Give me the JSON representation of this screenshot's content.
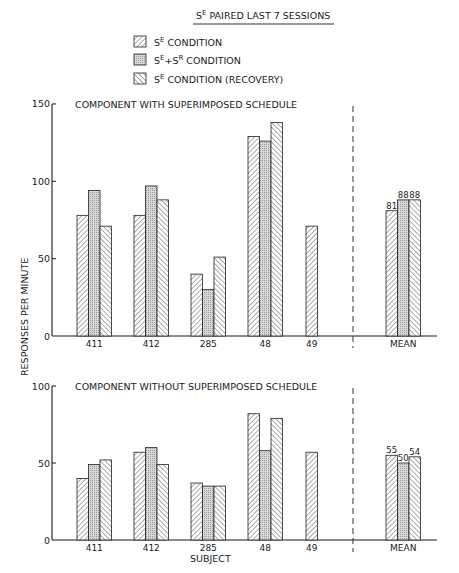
{
  "header": {
    "title_prefix": "S",
    "title_sup": "E",
    "title_rest": " PAIRED LAST 7 SESSIONS"
  },
  "legend": [
    {
      "pattern": "hatch-forward",
      "label_main": "S",
      "label_sup": "E",
      "label_rest": " CONDITION"
    },
    {
      "pattern": "stipple",
      "label_main": "S",
      "label_sup": "E",
      "label_mid": "+S",
      "label_sup2": "R",
      "label_rest": " CONDITION"
    },
    {
      "pattern": "hatch-back",
      "label_main": "S",
      "label_sup": "E",
      "label_rest": " CONDITION (RECOVERY)"
    }
  ],
  "y_axis_label": "RESPONSES PER MINUTE",
  "x_axis_label": "SUBJECT",
  "chart_data": [
    {
      "type": "bar",
      "title": "COMPONENT WITH SUPERIMPOSED SCHEDULE",
      "xlabel": "",
      "ylabel": "RESPONSES PER MINUTE",
      "ylim": [
        0,
        150
      ],
      "yticks": [
        0,
        50,
        100,
        150
      ],
      "categories": [
        "411",
        "412",
        "285",
        "48",
        "49",
        "MEAN"
      ],
      "series": [
        {
          "name": "SE CONDITION",
          "values": [
            78,
            78,
            40,
            129,
            71,
            81
          ]
        },
        {
          "name": "SE+SR CONDITION",
          "values": [
            94,
            97,
            30,
            126,
            null,
            88
          ]
        },
        {
          "name": "SE CONDITION (RECOVERY)",
          "values": [
            71,
            88,
            51,
            138,
            null,
            88
          ]
        }
      ],
      "mean_labels": [
        "81",
        "88",
        "88"
      ],
      "grid": false
    },
    {
      "type": "bar",
      "title": "COMPONENT WITHOUT SUPERIMPOSED SCHEDULE",
      "xlabel": "SUBJECT",
      "ylabel": "RESPONSES PER MINUTE",
      "ylim": [
        0,
        100
      ],
      "yticks": [
        0,
        50,
        100
      ],
      "categories": [
        "411",
        "412",
        "285",
        "48",
        "49",
        "MEAN"
      ],
      "series": [
        {
          "name": "SE CONDITION",
          "values": [
            40,
            57,
            37,
            82,
            57,
            55
          ]
        },
        {
          "name": "SE+SR CONDITION",
          "values": [
            49,
            60,
            35,
            58,
            null,
            50
          ]
        },
        {
          "name": "SE CONDITION (RECOVERY)",
          "values": [
            52,
            49,
            35,
            79,
            null,
            54
          ]
        }
      ],
      "mean_labels": [
        "55",
        "50",
        "54"
      ],
      "grid": false
    }
  ]
}
